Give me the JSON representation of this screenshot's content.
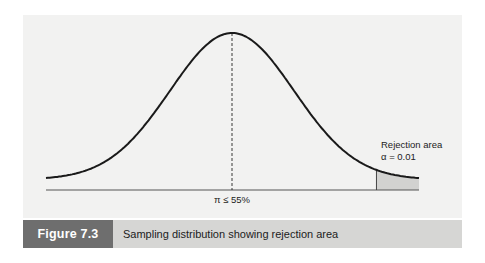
{
  "chart_data": {
    "type": "area",
    "title": "Sampling distribution showing rejection area",
    "figure_label": "Figure 7.3",
    "distribution": "normal",
    "x_range_sd": [
      -3.0,
      3.2
    ],
    "mean_label": "π ≤ 55%",
    "rejection_start_sd": 2.33,
    "annotation": {
      "line1": "Rejection area",
      "line2": "α = 0.01"
    },
    "xlabel": "",
    "ylabel": "",
    "grid": false,
    "legend": "none"
  },
  "colors": {
    "panel_bg": "#f2f2f1",
    "curve": "#1a1a1a",
    "shade": "#d2d2d0",
    "caption_label_bg": "#6e6e6e",
    "caption_text_bg": "#d6d6d4"
  }
}
